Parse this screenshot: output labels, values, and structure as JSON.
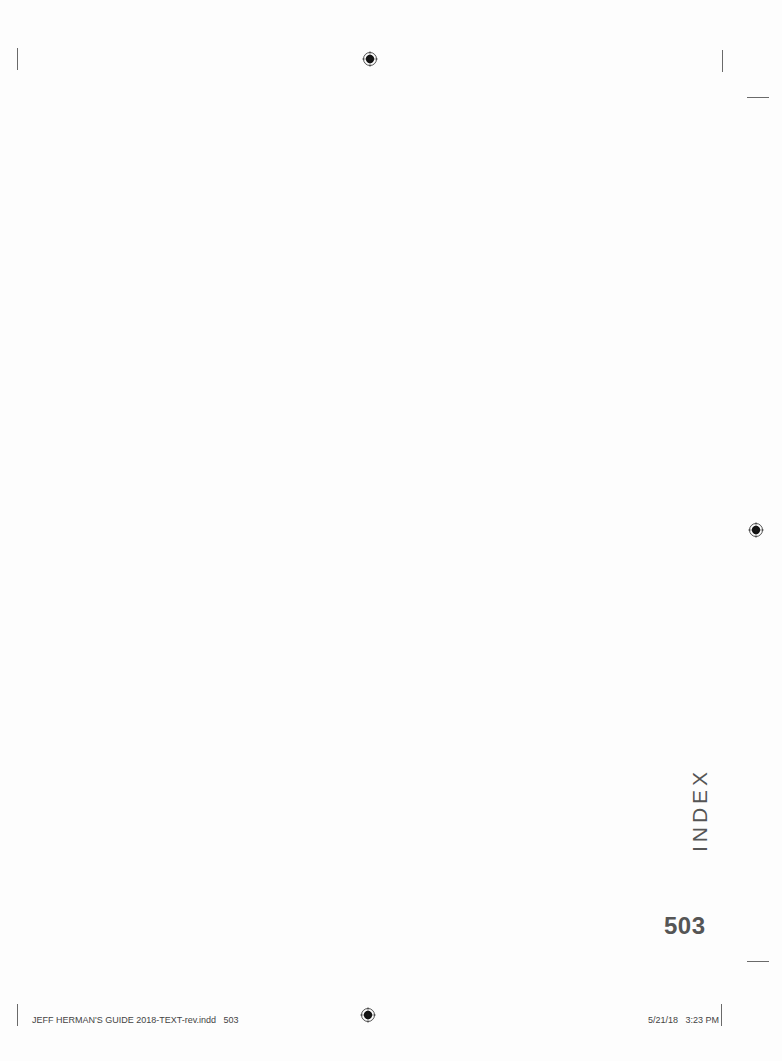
{
  "page": {
    "section_tab": "INDEX",
    "page_number": "503"
  },
  "slug": {
    "file_info": "JEFF HERMAN'S GUIDE 2018-TEXT-rev.indd   503",
    "timestamp": "5/21/18   3:23 PM"
  },
  "marks": {
    "registration_icon": "registration-target-icon",
    "color": "#222222"
  }
}
